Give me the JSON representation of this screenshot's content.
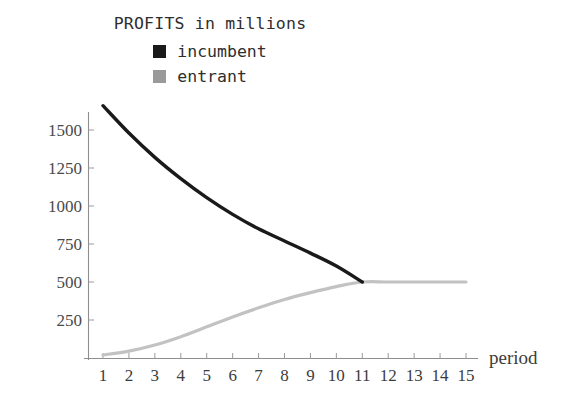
{
  "chart_data": {
    "type": "line",
    "title": "PROFITS in millions",
    "xlabel": "period",
    "ylabel": "",
    "x": [
      1,
      2,
      3,
      4,
      5,
      6,
      7,
      8,
      9,
      10,
      11,
      12,
      13,
      14,
      15
    ],
    "xlim": [
      0,
      15.6
    ],
    "ylim": [
      0,
      1720
    ],
    "xticks": [
      1,
      2,
      3,
      4,
      5,
      6,
      7,
      8,
      9,
      10,
      11,
      12,
      13,
      14,
      15
    ],
    "xtick_labels": [
      "1",
      "2",
      "3",
      "4",
      "5",
      "6",
      "7",
      "8",
      "9",
      "10",
      "11",
      "12",
      "13",
      "14",
      "15"
    ],
    "yticks": [
      250,
      500,
      750,
      1000,
      1250,
      1500
    ],
    "ytick_labels": [
      "250",
      "500",
      "750",
      "1000",
      "1250",
      "1500"
    ],
    "grid": false,
    "legend_position": "top-center",
    "series": [
      {
        "name": "incumbent",
        "color": "#1a1a1a",
        "line_width": 3.4,
        "values": [
          1660,
          1480,
          1320,
          1180,
          1055,
          945,
          850,
          770,
          690,
          605,
          500,
          null,
          null,
          null,
          null
        ]
      },
      {
        "name": "entrant",
        "color": "#c2c2c2",
        "line_width": 3.2,
        "values": [
          20,
          45,
          85,
          140,
          205,
          270,
          330,
          385,
          430,
          470,
          500,
          500,
          500,
          500,
          500
        ]
      }
    ]
  },
  "legend": {
    "items": [
      {
        "label": "incumbent",
        "swatch_color": "#1a1a1a"
      },
      {
        "label": "entrant",
        "swatch_color": "#9a9a9a"
      }
    ]
  },
  "axes": {
    "x_axis_name": "period",
    "axis_color": "#8e8e8e"
  }
}
